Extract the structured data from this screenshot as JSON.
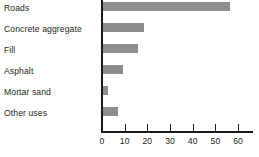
{
  "chart_data": {
    "type": "bar",
    "orientation": "horizontal",
    "title": "",
    "xlabel": "",
    "ylabel": "",
    "categories": [
      "Roads",
      "Concrete aggregate",
      "Fill",
      "Asphalt",
      "Mortar sand",
      "Other uses"
    ],
    "values": [
      56,
      18,
      15.5,
      9,
      2,
      6.5
    ],
    "xlim": [
      0,
      67
    ],
    "xticks": [
      0,
      10,
      20,
      30,
      40,
      50,
      60
    ],
    "xtick_labels": [
      "0",
      "10",
      "20",
      "30",
      "40",
      "50",
      "60"
    ],
    "grid": false,
    "legend": null,
    "bar_color": "#8d8d8d",
    "axis_color": "#1a1a1a",
    "text_color": "#231f20"
  }
}
